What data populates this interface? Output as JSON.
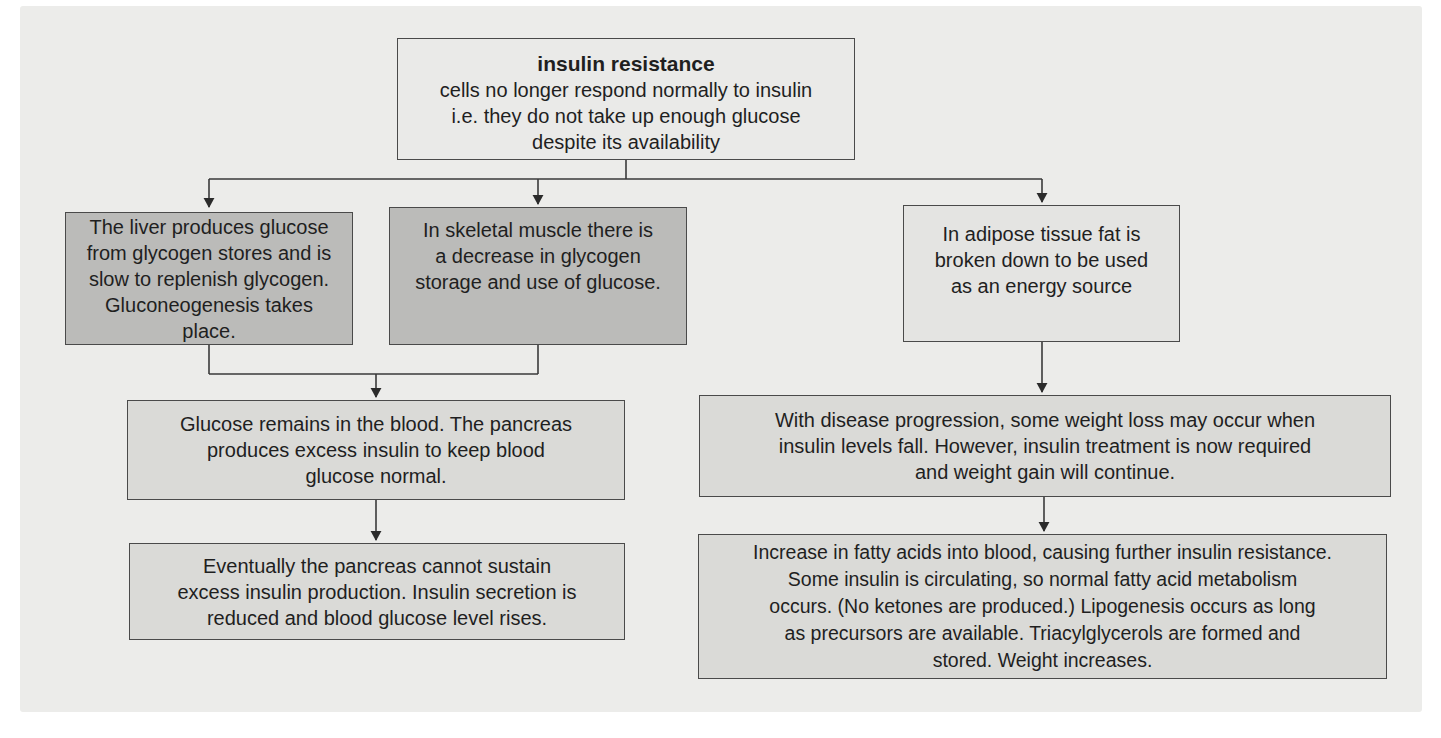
{
  "figure": {
    "kind": "flowchart",
    "topic": "insulin resistance",
    "panel_background": "#ECECEA",
    "palette": {
      "node_top_fill": "#EAEAE8",
      "node_dark_fill": "#BBBBB9",
      "node_light_fill": "#E4E4E2",
      "node_mid_fill": "#DADAD7",
      "border": "#4A4A4A",
      "connector_line": "#3A3A3A",
      "text": "#1F1F1F"
    }
  },
  "nodes": {
    "insulin_resistance": {
      "title": "insulin resistance",
      "body": [
        "cells no longer respond normally to insulin",
        "i.e. they do not take up enough glucose",
        "despite its availability"
      ]
    },
    "liver": {
      "body": [
        "The liver produces glucose",
        "from glycogen stores and is",
        "slow to replenish glycogen.",
        "Gluconeogenesis takes",
        "place."
      ]
    },
    "muscle": {
      "body": [
        "In skeletal muscle there is",
        "a decrease in glycogen",
        "storage and use of glucose."
      ]
    },
    "adipose": {
      "body": [
        "In adipose tissue fat is",
        "broken down to be used",
        "as an energy source"
      ]
    },
    "glucose_blood": {
      "body": [
        "Glucose remains in the blood. The pancreas",
        "produces excess insulin to keep blood",
        "glucose normal."
      ]
    },
    "pancreas_fail": {
      "body": [
        "Eventually the pancreas cannot sustain",
        "excess insulin production. Insulin secretion is",
        "reduced and blood glucose level rises."
      ]
    },
    "weight_loss": {
      "body": [
        "With disease progression, some weight loss may occur when",
        "insulin levels fall. However, insulin treatment is now required",
        "and weight gain will continue."
      ]
    },
    "fatty_acids": {
      "body": [
        "Increase in fatty acids into blood, causing further insulin resistance.",
        "Some insulin is circulating, so normal fatty acid metabolism",
        "occurs. (No ketones are produced.) Lipogenesis occurs as long",
        "as precursors are available. Triacylglycerols are formed and",
        "stored. Weight increases."
      ]
    }
  },
  "edges": [
    {
      "from": "insulin_resistance",
      "to": "liver"
    },
    {
      "from": "insulin_resistance",
      "to": "muscle"
    },
    {
      "from": "insulin_resistance",
      "to": "adipose"
    },
    {
      "from": "liver",
      "to": "glucose_blood"
    },
    {
      "from": "muscle",
      "to": "glucose_blood"
    },
    {
      "from": "glucose_blood",
      "to": "pancreas_fail"
    },
    {
      "from": "adipose",
      "to": "weight_loss"
    },
    {
      "from": "weight_loss",
      "to": "fatty_acids"
    }
  ]
}
